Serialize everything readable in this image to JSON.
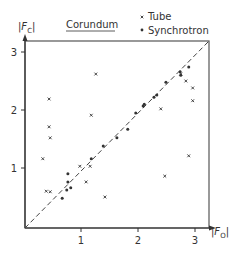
{
  "chart_data": {
    "type": "scatter",
    "title": "Corundum",
    "xlabel": "|F_O|",
    "ylabel": "|F_C|",
    "xlim": [
      0,
      3.25
    ],
    "ylim": [
      0,
      3.2
    ],
    "xticks": [
      1,
      2,
      3
    ],
    "yticks": [
      1,
      2,
      3
    ],
    "grid": false,
    "legend_position": "top-right",
    "reference_line": {
      "type": "diagonal",
      "style": "dashed",
      "from": [
        0,
        0
      ],
      "to": [
        3.2,
        3.2
      ]
    },
    "series": [
      {
        "name": "Tube",
        "marker": "x",
        "points": [
          [
            1.26,
            2.62
          ],
          [
            0.44,
            2.19
          ],
          [
            1.18,
            1.91
          ],
          [
            0.44,
            1.71
          ],
          [
            0.46,
            1.52
          ],
          [
            0.33,
            1.16
          ],
          [
            0.98,
            1.03
          ],
          [
            1.16,
            1.03
          ],
          [
            1.09,
            0.76
          ],
          [
            0.39,
            0.6
          ],
          [
            0.46,
            0.59
          ],
          [
            1.42,
            0.5
          ],
          [
            2.4,
            2.02
          ],
          [
            2.84,
            2.5
          ],
          [
            2.96,
            2.38
          ],
          [
            2.96,
            2.16
          ],
          [
            2.89,
            1.21
          ],
          [
            2.47,
            0.86
          ],
          [
            2.75,
            2.62
          ]
        ]
      },
      {
        "name": "Synchrotron",
        "marker": "dot",
        "points": [
          [
            2.89,
            2.74
          ],
          [
            2.74,
            2.66
          ],
          [
            2.75,
            2.6
          ],
          [
            2.49,
            2.48
          ],
          [
            2.33,
            2.26
          ],
          [
            2.28,
            2.22
          ],
          [
            2.11,
            2.1
          ],
          [
            2.09,
            2.07
          ],
          [
            1.96,
            1.95
          ],
          [
            1.82,
            1.67
          ],
          [
            1.63,
            1.52
          ],
          [
            1.39,
            1.38
          ],
          [
            1.18,
            1.16
          ],
          [
            0.77,
            0.9
          ],
          [
            0.77,
            0.76
          ],
          [
            0.75,
            0.62
          ],
          [
            0.82,
            0.66
          ],
          [
            0.67,
            0.48
          ]
        ]
      }
    ]
  },
  "labels": {
    "title": "Corundum",
    "ylabel_main": "|F",
    "ylabel_sub": "C",
    "ylabel_end": "|",
    "xlabel_main": "|F",
    "xlabel_sub": "O",
    "xlabel_end": "|",
    "legend_tube": "Tube",
    "legend_synchrotron": "Synchrotron",
    "xtick_1": "1",
    "xtick_2": "2",
    "xtick_3": "3",
    "ytick_1": "1",
    "ytick_2": "2",
    "ytick_3": "3"
  }
}
